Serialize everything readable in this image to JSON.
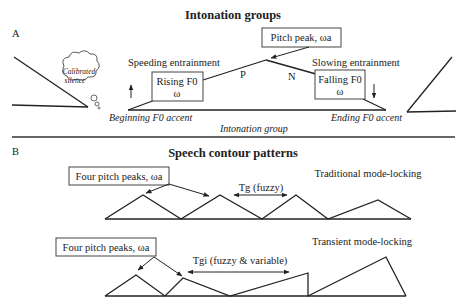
{
  "panel_a": {
    "label": "A",
    "title": "Intonation groups",
    "cloud_line1": "Calibrated",
    "cloud_line2": "silence",
    "speeding": "Speeding entrainment",
    "rising_box_line1": "Rising F0",
    "rising_box_line2": "ω",
    "pitch_peak_box": "Pitch peak, ωa",
    "p_label": "P",
    "n_label": "N",
    "slowing": "Slowing entrainment",
    "falling_box_line1": "Falling F0",
    "falling_box_line2": "ω",
    "beginning": "Beginning F0 accent",
    "ending": "Ending  F0 accent",
    "group": "Intonation group"
  },
  "panel_b": {
    "label": "B",
    "title": "Speech contour patterns",
    "traditional": {
      "peaks_box": "Four pitch peaks, ωa",
      "period_label": "Tg (fuzzy)",
      "mode_label": "Traditional mode-locking"
    },
    "transient": {
      "peaks_box": "Four pitch peaks, ωa",
      "period_label": "Tgi (fuzzy & variable)",
      "mode_label": "Transient mode-locking"
    }
  },
  "colors": {
    "line": "#222222",
    "box_border": "#444444",
    "background": "#ffffff"
  }
}
